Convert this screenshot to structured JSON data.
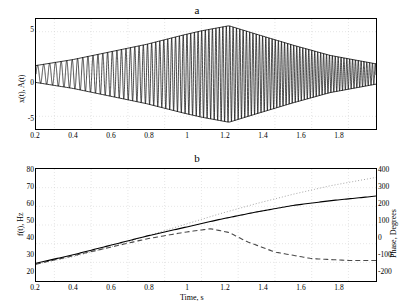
{
  "figure": {
    "background": "#ffffff",
    "line_color": "#000000",
    "grid_color": "#cccccc"
  },
  "panel_a": {
    "title": "a",
    "ylabel": "x(t), A(t)",
    "xticks": [
      "0.2",
      "0.4",
      "0.6",
      "0.8",
      "1",
      "1.2",
      "1.4",
      "1.6",
      "1.8"
    ],
    "yticks": [
      "5",
      "0",
      "-5"
    ]
  },
  "panel_b": {
    "title": "b",
    "ylabel_left": "f(t), Hz",
    "ylabel_right": "Phase, Degrees",
    "xlabel": "Time, s",
    "xticks": [
      "0.2",
      "0.4",
      "0.6",
      "0.8",
      "1",
      "1.2",
      "1.4",
      "1.6",
      "1.8"
    ],
    "yticks_left": [
      "80",
      "70",
      "60",
      "50",
      "40",
      "30",
      "20"
    ],
    "yticks_right": [
      "400",
      "300",
      "200",
      "100",
      "0",
      "-100",
      "-200"
    ]
  },
  "chart_data": [
    {
      "type": "line",
      "title": "a",
      "xlabel": "",
      "ylabel": "x(t), A(t)",
      "xlim": [
        0.1,
        1.95
      ],
      "ylim": [
        -6.5,
        6.5
      ],
      "grid": true,
      "series": [
        {
          "name": "x(t)",
          "description": "amplitude-modulated chirp oscillation, frequency increasing with time, envelope peaking near t=1.15",
          "style": "solid",
          "color": "#000000"
        },
        {
          "name": "A(t)",
          "description": "envelope, rises linearly from ~1 at t=0.1 to ~5.7 at t=1.15 then falls to ~1.2 at t=1.95",
          "style": "solid",
          "color": "#000000",
          "envelope_x": [
            0.1,
            0.3,
            0.5,
            0.7,
            0.9,
            1.0,
            1.15,
            1.3,
            1.5,
            1.7,
            1.95
          ],
          "envelope_y": [
            1.0,
            1.7,
            2.6,
            3.5,
            4.6,
            5.1,
            5.7,
            4.7,
            3.4,
            2.2,
            1.2
          ]
        }
      ]
    },
    {
      "type": "line",
      "title": "b",
      "xlabel": "Time, s",
      "ylabel": "f(t), Hz",
      "ylabel_secondary": "Phase, Degrees",
      "xlim": [
        0.1,
        1.95
      ],
      "ylim": [
        20,
        80
      ],
      "ylim_secondary": [
        -200,
        400
      ],
      "grid": true,
      "series": [
        {
          "name": "f(t)",
          "style": "solid",
          "color": "#000000",
          "axis": "left",
          "x": [
            0.1,
            0.3,
            0.5,
            0.7,
            0.9,
            1.1,
            1.3,
            1.5,
            1.7,
            1.95
          ],
          "y": [
            29.5,
            34.0,
            39.0,
            44.0,
            48.5,
            53.0,
            57.0,
            60.5,
            63.0,
            65.5
          ]
        },
        {
          "name": "phase-dotted",
          "style": "dotted",
          "color": "#808080",
          "axis": "right",
          "x": [
            0.1,
            0.3,
            0.5,
            0.7,
            0.9,
            1.1,
            1.3,
            1.5,
            1.7,
            1.95
          ],
          "y": [
            -110,
            -70,
            -20,
            40,
            100,
            160,
            215,
            265,
            310,
            355
          ]
        },
        {
          "name": "phase-dashed",
          "style": "dashed",
          "color": "#555555",
          "axis": "left",
          "x": [
            0.1,
            0.3,
            0.5,
            0.7,
            0.9,
            1.05,
            1.15,
            1.25,
            1.4,
            1.6,
            1.8,
            1.95
          ],
          "y": [
            29.0,
            33.5,
            38.0,
            42.5,
            46.0,
            48.0,
            46.0,
            41.0,
            35.5,
            32.0,
            31.0,
            31.0
          ]
        }
      ]
    }
  ]
}
